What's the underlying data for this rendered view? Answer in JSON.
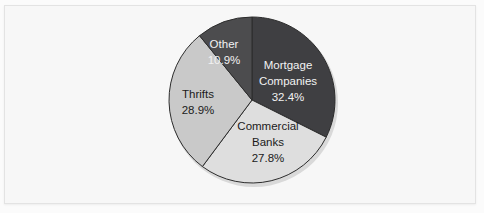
{
  "chart_data": {
    "type": "pie",
    "title": "",
    "subtitle": "",
    "xlabel": "",
    "ylabel": "",
    "legend_position": "none",
    "grid": false,
    "labels_inside_slices": true,
    "start_angle_deg": 0,
    "direction": "clockwise",
    "categories": [
      "Mortgage Companies",
      "Commercial Banks",
      "Thrifts",
      "Other"
    ],
    "values": [
      32.4,
      27.8,
      28.9,
      10.9
    ],
    "value_suffix": "%",
    "slices": [
      {
        "name": "Mortgage Companies",
        "label_line1": "Mortgage",
        "label_line2": "Companies",
        "value": 32.4,
        "value_text": "32.4%",
        "color": "#3f3f42",
        "text_color": "#f2f2f2",
        "start_deg": 0,
        "end_deg": 116.6
      },
      {
        "name": "Commercial Banks",
        "label_line1": "Commercial",
        "label_line2": "Banks",
        "value": 27.8,
        "value_text": "27.8%",
        "color": "#dedede",
        "text_color": "#1b1b1b",
        "start_deg": 116.6,
        "end_deg": 216.7
      },
      {
        "name": "Thrifts",
        "label_line1": "Thrifts",
        "label_line2": "",
        "value": 28.9,
        "value_text": "28.9%",
        "color": "#c9c9c9",
        "text_color": "#1b1b1b",
        "start_deg": 216.7,
        "end_deg": 320.8
      },
      {
        "name": "Other",
        "label_line1": "Other",
        "label_line2": "",
        "value": 10.9,
        "value_text": "10.9%",
        "color": "#4c4c4e",
        "text_color": "#f2f2f2",
        "start_deg": 320.8,
        "end_deg": 360
      }
    ]
  },
  "colors": {
    "background": "#f7f7f7",
    "page_background": "#fbfbfb",
    "frame_border": "#e3e3e3",
    "slice_outline": "#2c2c2c",
    "mortgage_companies": "#3f3f42",
    "commercial_banks": "#dedede",
    "thrifts": "#c9c9c9",
    "other": "#4c4c4e"
  }
}
